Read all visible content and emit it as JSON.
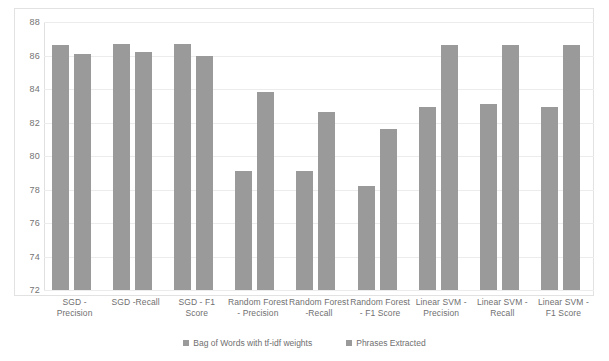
{
  "chart_data": {
    "type": "bar",
    "title": "",
    "xlabel": "",
    "ylabel": "",
    "ylim": [
      72,
      88
    ],
    "yticks": [
      72,
      74,
      76,
      78,
      80,
      82,
      84,
      86,
      88
    ],
    "grid": true,
    "legend_position": "bottom",
    "categories": [
      "SGD - Precision",
      "SGD -Recall",
      "SGD - F1 Score",
      "Random Forest - Precision",
      "Random Forest -Recall",
      "Random Forest - F1 Score",
      "Linear SVM - Precision",
      "Linear SVM - Recall",
      "Linear SVM - F1 Score"
    ],
    "series": [
      {
        "name": "Bag of Words with tf-idf weights",
        "color": "#9a9a9a",
        "values": [
          86.6,
          86.7,
          86.7,
          79.1,
          79.1,
          78.2,
          82.9,
          83.1,
          82.9
        ]
      },
      {
        "name": "Phrases Extracted",
        "color": "#9a9a9a",
        "values": [
          86.1,
          86.2,
          86.0,
          83.8,
          82.6,
          81.6,
          86.6,
          86.6,
          86.6
        ]
      }
    ]
  },
  "legend": {
    "items": [
      "Bag of Words with tf-idf weights",
      "Phrases Extracted"
    ]
  }
}
